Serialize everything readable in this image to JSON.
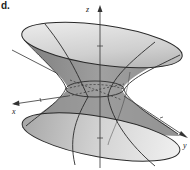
{
  "figure": {
    "panel_label": "d.",
    "surface": "hyperboloid of one sheet",
    "axes": {
      "x_label": "x",
      "y_label": "y",
      "z_label": "z"
    },
    "colors": {
      "surface_light": "#e6e6e6",
      "surface_mid": "#b8b8b8",
      "surface_dark": "#8c8c8c",
      "outline": "#2a2a2a"
    }
  }
}
